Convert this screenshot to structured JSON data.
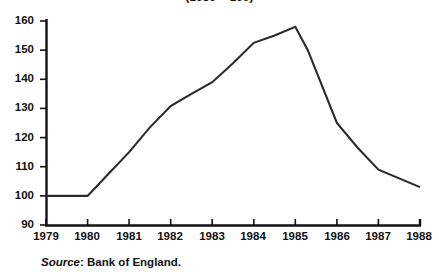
{
  "chart_data": {
    "type": "line",
    "title": "(1980 = 100)",
    "xlabel": "",
    "ylabel": "",
    "xlim": [
      1979,
      1988
    ],
    "ylim": [
      90,
      160
    ],
    "grid": false,
    "legend": "none",
    "x_tick_labels": [
      "1979",
      "1980",
      "1981",
      "1982",
      "1983",
      "1984",
      "1985",
      "1986",
      "1987",
      "1988"
    ],
    "y_tick_labels": [
      "90",
      "100",
      "110",
      "120",
      "130",
      "140",
      "150",
      "160"
    ],
    "x_ticks": [
      1979,
      1980,
      1981,
      1982,
      1983,
      1984,
      1985,
      1986,
      1987,
      1988
    ],
    "y_ticks": [
      90,
      100,
      110,
      120,
      130,
      140,
      150,
      160
    ],
    "categories": [
      "1979",
      "1980",
      "1981",
      "1982",
      "1983",
      "1984",
      "1985",
      "1986",
      "1987",
      "1988"
    ],
    "values": [
      100,
      100,
      115,
      131,
      139,
      152.5,
      158,
      125,
      109,
      103
    ],
    "series": [
      {
        "name": "Index",
        "points": [
          {
            "x": 1979.0,
            "y": 100.0
          },
          {
            "x": 1980.0,
            "y": 100.0
          },
          {
            "x": 1980.5,
            "y": 107.5
          },
          {
            "x": 1981.0,
            "y": 115.0
          },
          {
            "x": 1981.5,
            "y": 123.5
          },
          {
            "x": 1982.0,
            "y": 130.8
          },
          {
            "x": 1982.5,
            "y": 135.0
          },
          {
            "x": 1983.0,
            "y": 139.0
          },
          {
            "x": 1983.5,
            "y": 145.5
          },
          {
            "x": 1984.0,
            "y": 152.5
          },
          {
            "x": 1984.5,
            "y": 155.0
          },
          {
            "x": 1985.0,
            "y": 158.0
          },
          {
            "x": 1985.3,
            "y": 150.0
          },
          {
            "x": 1986.0,
            "y": 125.0
          },
          {
            "x": 1986.5,
            "y": 116.5
          },
          {
            "x": 1987.0,
            "y": 109.0
          },
          {
            "x": 1988.0,
            "y": 103.0
          }
        ]
      }
    ],
    "annotations": []
  },
  "source": {
    "label": "Source",
    "separator": ":",
    "text": "Bank of England."
  }
}
